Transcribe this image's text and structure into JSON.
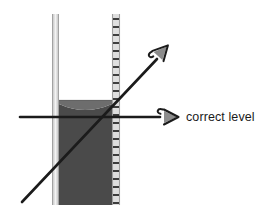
{
  "diagram": {
    "labels": [
      {
        "id": "correct_level",
        "text": "correct level"
      }
    ],
    "colors": {
      "background": "#ffffff",
      "liquid": "#4a4a4a",
      "liquid_meniscus_shade": "#6f6f6f",
      "glass_wall": "#d9d9d9",
      "glass_wall_edge": "#a8a8a8",
      "tick_mark": "#3d3d3d",
      "line": "#1b1b1b",
      "arrow_fill": "#8c8c8c",
      "text": "#1b1b1b"
    },
    "cylinder": {
      "left_wall_x": 52,
      "right_wall_x": 112,
      "top_y": 14,
      "bottom_y": 205,
      "wall_thickness": 7,
      "graduations_side": "right",
      "tick_count": 23,
      "tick_spacing_px": 8
    },
    "liquid": {
      "surface_y": 100,
      "meniscus_shape": "concave",
      "bottom_y": 205
    },
    "lines": [
      {
        "id": "correct_sight_line",
        "type": "horizontal",
        "x1": 20,
        "y1": 117,
        "x2": 160,
        "y2": 117,
        "arrow": "right-hooked"
      },
      {
        "id": "incorrect_sight_line",
        "type": "diagonal",
        "x1": 22,
        "y1": 202,
        "x2": 158,
        "y2": 58,
        "arrow": "upright-hooked"
      }
    ],
    "icons": {
      "eye_arrow_upper": "hooked-arrowhead-icon",
      "eye_arrow_lower": "hooked-arrowhead-icon"
    }
  }
}
